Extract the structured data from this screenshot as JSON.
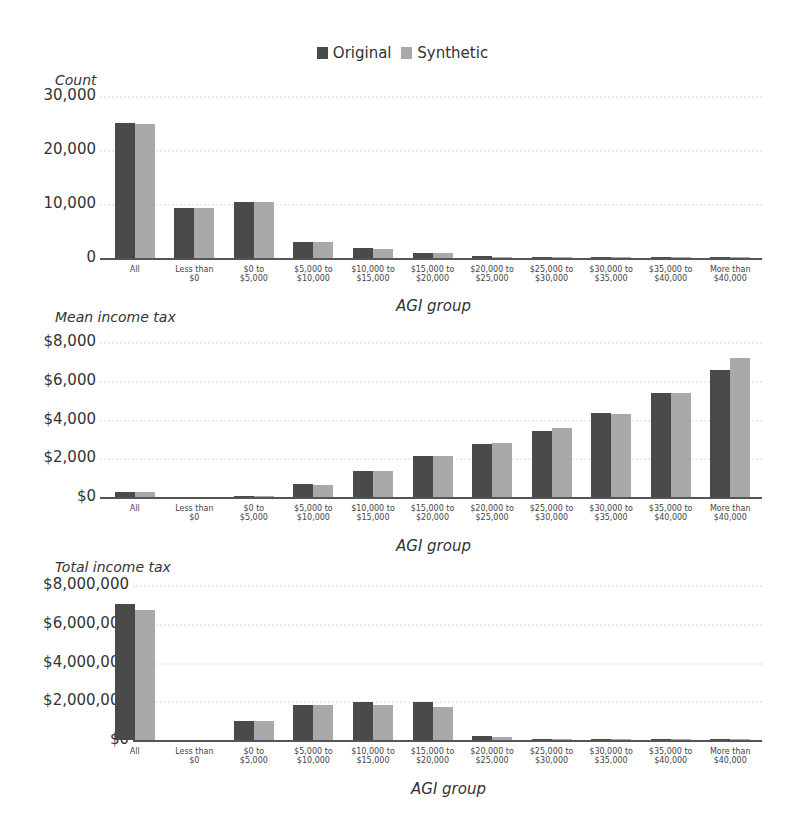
{
  "legend": {
    "items": [
      {
        "label": "Original",
        "color": "#4a4a4a"
      },
      {
        "label": "Synthetic",
        "color": "#a9a9a9"
      }
    ]
  },
  "chart_data": [
    {
      "type": "bar",
      "title": "",
      "ylabel": "Count",
      "xlabel": "AGI group",
      "categories": [
        "All",
        "Less than $0",
        "$0 to $5,000",
        "$5,000 to $10,000",
        "$10,000 to $15,000",
        "$15,000 to $20,000",
        "$20,000 to $25,000",
        "$25,000 to $30,000",
        "$30,000 to $35,000",
        "$35,000 to $40,000",
        "More than $40,000"
      ],
      "series": [
        {
          "name": "Original",
          "values": [
            25000,
            9300,
            10400,
            3000,
            1800,
            1000,
            300,
            150,
            80,
            50,
            200
          ]
        },
        {
          "name": "Synthetic",
          "values": [
            24900,
            9200,
            10400,
            3000,
            1600,
            900,
            250,
            120,
            70,
            40,
            200
          ]
        }
      ],
      "yticks": [
        "0",
        "10,000",
        "20,000",
        "30,000"
      ],
      "ylim": [
        0,
        30000
      ],
      "grid": true,
      "legend_position": "top"
    },
    {
      "type": "bar",
      "title": "",
      "ylabel": "Mean income tax",
      "xlabel": "AGI group",
      "categories": [
        "All",
        "Less than $0",
        "$0 to $5,000",
        "$5,000 to $10,000",
        "$10,000 to $15,000",
        "$15,000 to $20,000",
        "$20,000 to $25,000",
        "$25,000 to $30,000",
        "$30,000 to $35,000",
        "$35,000 to $40,000",
        "More than $40,000"
      ],
      "series": [
        {
          "name": "Original",
          "values": [
            250,
            0,
            50,
            650,
            1350,
            2100,
            2750,
            3400,
            4350,
            5350,
            6550
          ]
        },
        {
          "name": "Synthetic",
          "values": [
            240,
            0,
            40,
            640,
            1350,
            2100,
            2800,
            3550,
            4300,
            5350,
            7150
          ]
        }
      ],
      "yticks": [
        "$0",
        "$2,000",
        "$4,000",
        "$6,000",
        "$8,000"
      ],
      "ylim": [
        0,
        8000
      ],
      "grid": true,
      "legend_position": "top"
    },
    {
      "type": "bar",
      "title": "",
      "ylabel": "Total income tax",
      "xlabel": "AGI group",
      "categories": [
        "All",
        "Less than $0",
        "$0 to $5,000",
        "$5,000 to $10,000",
        "$10,000 to $15,000",
        "$15,000 to $20,000",
        "$20,000 to $25,000",
        "$25,000 to $30,000",
        "$30,000 to $35,000",
        "$35,000 to $40,000",
        "More than $40,000"
      ],
      "series": [
        {
          "name": "Original",
          "values": [
            7000000,
            0,
            1000000,
            1800000,
            1950000,
            1950000,
            200000,
            60000,
            40000,
            30000,
            50000
          ]
        },
        {
          "name": "Synthetic",
          "values": [
            6700000,
            0,
            1000000,
            1800000,
            1800000,
            1700000,
            180000,
            50000,
            30000,
            25000,
            40000
          ]
        }
      ],
      "yticks": [
        "$0",
        "$2,000,000",
        "$4,000,000",
        "$6,000,000",
        "$8,000,000"
      ],
      "ylim": [
        0,
        8000000
      ],
      "grid": true,
      "legend_position": "top"
    }
  ],
  "xlabels": [
    [
      "All",
      ""
    ],
    [
      "Less than",
      "$0"
    ],
    [
      "$0 to",
      "$5,000"
    ],
    [
      "$5,000 to",
      "$10,000"
    ],
    [
      "$10,000 to",
      "$15,000"
    ],
    [
      "$15,000 to",
      "$20,000"
    ],
    [
      "$20,000 to",
      "$25,000"
    ],
    [
      "$25,000 to",
      "$30,000"
    ],
    [
      "$30,000 to",
      "$35,000"
    ],
    [
      "$35,000 to",
      "$40,000"
    ],
    [
      "More than",
      "$40,000"
    ]
  ]
}
